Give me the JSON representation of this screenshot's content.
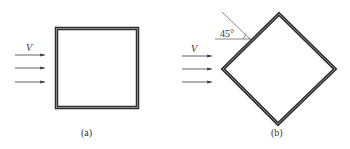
{
  "figure": {
    "panels": [
      {
        "id": "a",
        "caption": "(a)",
        "shape": "square",
        "flow_label": "V",
        "flow_arrows": 3
      },
      {
        "id": "b",
        "caption": "(b)",
        "shape": "diamond (square rotated 45°)",
        "flow_label": "V",
        "flow_arrows": 3,
        "angle_label": "45°"
      }
    ],
    "colors": {
      "outline": "#2e2e2e",
      "outline_inner": "#8a8a8a",
      "arrow": "#3a3a3a",
      "thin_line": "#555555"
    }
  }
}
